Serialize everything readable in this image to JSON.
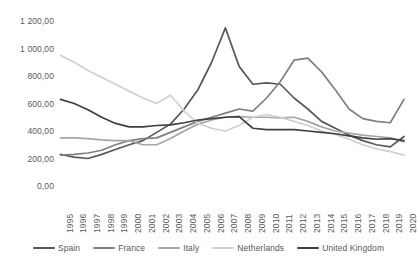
{
  "chart_data": {
    "type": "line",
    "title": "",
    "xlabel": "",
    "ylabel": "",
    "grid": false,
    "legend_position": "bottom",
    "ylim": [
      0,
      1200
    ],
    "ytick_labels": [
      "1 200,00",
      "1 000,00",
      "800,00",
      "600,00",
      "400,00",
      "200,00",
      "0,00"
    ],
    "ytick_values": [
      1200,
      1000,
      800,
      600,
      400,
      200,
      0
    ],
    "categories": [
      "1995",
      "1996",
      "1997",
      "1998",
      "1999",
      "2000",
      "2001",
      "2002",
      "2003",
      "2004",
      "2005",
      "2006",
      "2007",
      "2008",
      "2009",
      "2010",
      "2011",
      "2012",
      "2013",
      "2014",
      "2015",
      "2016",
      "2017",
      "2018",
      "2019",
      "2020"
    ],
    "series": [
      {
        "name": "Spain",
        "color": "#595959",
        "values": [
          230,
          210,
          200,
          230,
          265,
          300,
          330,
          390,
          450,
          560,
          700,
          900,
          1150,
          870,
          740,
          750,
          740,
          640,
          560,
          470,
          420,
          370,
          330,
          300,
          285,
          360
        ]
      },
      {
        "name": "France",
        "color": "#808080",
        "values": [
          225,
          230,
          240,
          260,
          300,
          330,
          345,
          350,
          390,
          430,
          470,
          500,
          530,
          560,
          545,
          640,
          760,
          915,
          930,
          830,
          700,
          560,
          490,
          470,
          460,
          630
        ]
      },
      {
        "name": "Italy",
        "color": "#a6a6a6",
        "values": [
          350,
          350,
          345,
          335,
          330,
          330,
          300,
          300,
          345,
          400,
          450,
          480,
          500,
          505,
          500,
          500,
          495,
          500,
          470,
          430,
          400,
          385,
          370,
          360,
          350,
          320
        ]
      },
      {
        "name": "Netherlands",
        "color": "#d0d0d0",
        "values": [
          950,
          900,
          840,
          790,
          740,
          690,
          640,
          600,
          660,
          545,
          455,
          420,
          400,
          440,
          500,
          520,
          500,
          470,
          440,
          400,
          375,
          340,
          300,
          270,
          250,
          225
        ]
      },
      {
        "name": "United Kingdom",
        "color": "#404040",
        "values": [
          630,
          600,
          555,
          500,
          455,
          430,
          430,
          440,
          445,
          460,
          480,
          490,
          500,
          505,
          420,
          410,
          410,
          410,
          400,
          390,
          380,
          365,
          350,
          340,
          345,
          330
        ]
      }
    ]
  },
  "axis": {
    "y_ticks": [
      {
        "label": "1 200,00"
      },
      {
        "label": "1 000,00"
      },
      {
        "label": "800,00"
      },
      {
        "label": "600,00"
      },
      {
        "label": "400,00"
      },
      {
        "label": "200,00"
      },
      {
        "label": "0,00"
      }
    ]
  },
  "legend": {
    "items": [
      {
        "label": "Spain",
        "color": "#595959"
      },
      {
        "label": "France",
        "color": "#808080"
      },
      {
        "label": "Italy",
        "color": "#a6a6a6"
      },
      {
        "label": "Netherlands",
        "color": "#d0d0d0"
      },
      {
        "label": "United Kingdom",
        "color": "#404040"
      }
    ]
  }
}
